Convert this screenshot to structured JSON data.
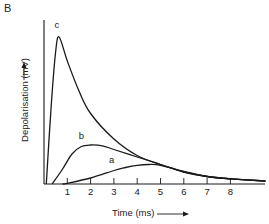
{
  "chart_data": {
    "type": "line",
    "panel_label": "B",
    "title": "",
    "xlabel": "Time (ms)",
    "ylabel": "Depolarisation (mV)",
    "x_ticks": [
      1,
      2,
      3,
      4,
      5,
      6,
      7,
      8
    ],
    "xlim": [
      0,
      9.5
    ],
    "ylim": [
      0,
      100
    ],
    "y_ticks": [],
    "grid": false,
    "legend": "none (curves labelled directly)",
    "series": [
      {
        "name": "c",
        "x": [
          0.1,
          0.3,
          0.5,
          0.65,
          1.0,
          1.5,
          2.0,
          3.0,
          4.0,
          5.0,
          6.0,
          7.0,
          8.0,
          9.5
        ],
        "values": [
          0,
          50,
          88,
          98,
          82,
          62,
          47,
          30,
          19,
          13,
          8,
          5,
          3.5,
          2
        ]
      },
      {
        "name": "b",
        "x": [
          0.35,
          0.8,
          1.2,
          1.6,
          2.0,
          2.5,
          3.0,
          4.0,
          5.0,
          6.0,
          7.0,
          8.0,
          9.5
        ],
        "values": [
          0,
          10,
          20,
          25,
          26,
          25.5,
          23,
          18,
          13,
          8,
          5,
          3.5,
          2
        ]
      },
      {
        "name": "a",
        "x": [
          0.8,
          1.0,
          2.0,
          3.0,
          3.5,
          4.0,
          4.5,
          5.0,
          6.0,
          7.0,
          8.0,
          9.5
        ],
        "values": [
          0,
          0.5,
          4,
          9,
          11,
          12.5,
          13,
          12.5,
          8.5,
          5,
          3.5,
          2
        ]
      }
    ],
    "annotations": [
      "a",
      "b",
      "c"
    ]
  },
  "layout": {
    "origin_px": [
      44,
      184
    ],
    "px_per_ms": 23.3,
    "px_per_unit": 1.5,
    "x_axis_end_px": 265,
    "y_axis_top_px": 20,
    "line_color": "#1a1a1a",
    "curve_label_positions": {
      "a": [
        2.9,
        14
      ],
      "b": [
        1.6,
        30
      ],
      "c": [
        0.55,
        104
      ]
    }
  }
}
